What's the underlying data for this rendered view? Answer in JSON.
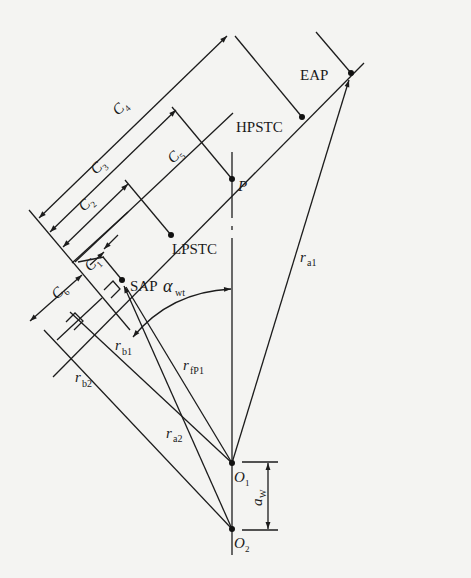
{
  "diagram": {
    "type": "gear-mesh-line-of-action",
    "points": {
      "EAP": "EAP",
      "HPSTC": "HPSTC",
      "P": "P",
      "LPSTC": "LPSTC",
      "SAP": "SAP",
      "O1": "O",
      "O1_sub": "1",
      "O2": "O",
      "O2_sub": "2"
    },
    "dimensions": {
      "C1": {
        "base": "C",
        "sub": "1"
      },
      "C2": {
        "base": "C",
        "sub": "2"
      },
      "C3": {
        "base": "C",
        "sub": "3"
      },
      "C4": {
        "base": "C",
        "sub": "4"
      },
      "C5": {
        "base": "C",
        "sub": "5"
      },
      "C6": {
        "base": "C",
        "sub": "6"
      },
      "aw": {
        "base": "a",
        "sub": "W"
      }
    },
    "radii": {
      "ra1": {
        "base": "r",
        "sub": "a1"
      },
      "ra2": {
        "base": "r",
        "sub": "a2"
      },
      "rb1": {
        "base": "r",
        "sub": "b1"
      },
      "rb2": {
        "base": "r",
        "sub": "b2"
      },
      "rfP1": {
        "base": "r",
        "sub": "fP1"
      }
    },
    "angle": {
      "base": "α",
      "sub": "wt"
    }
  }
}
